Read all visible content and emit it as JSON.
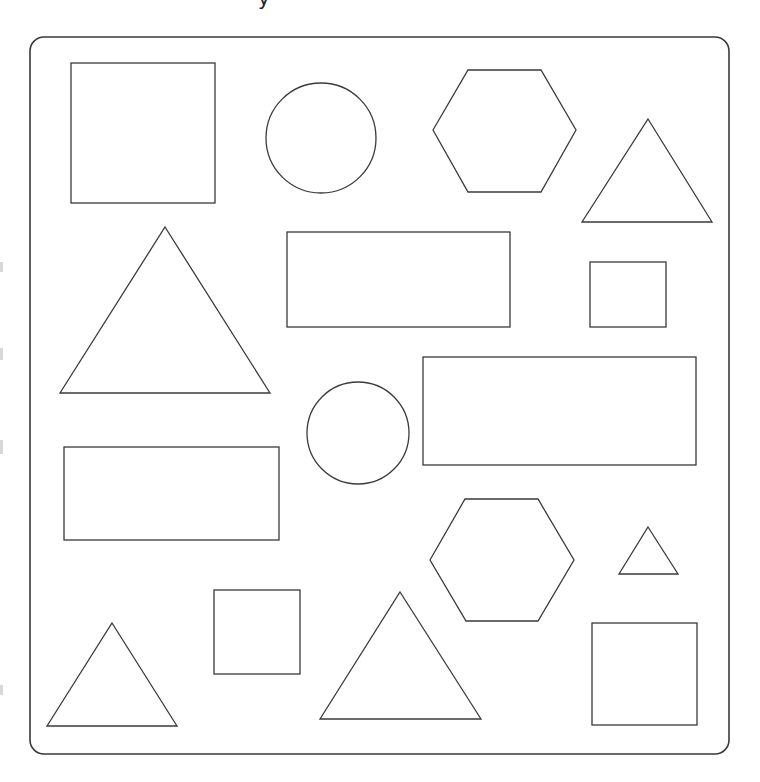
{
  "page": {
    "width": 760,
    "height": 782,
    "background": "#ffffff",
    "stroke_color": "#3a3a3a",
    "cut_off_text": "y"
  },
  "frame": {
    "x": 30,
    "y": 37,
    "width": 699,
    "height": 717,
    "radius": 14
  },
  "shapes": [
    {
      "id": "square-1",
      "type": "rect",
      "x": 71,
      "y": 63,
      "width": 144,
      "height": 140
    },
    {
      "id": "circle-1",
      "type": "circle",
      "cx": 321,
      "cy": 138,
      "r": 55
    },
    {
      "id": "hexagon-1",
      "type": "polygon",
      "points": "433,130 468,70 541,70 576,130 541,192 468,192"
    },
    {
      "id": "triangle-1",
      "type": "polygon",
      "points": "648,119 712,222 582,222"
    },
    {
      "id": "triangle-2",
      "type": "polygon",
      "points": "165,227 270,393 60,393"
    },
    {
      "id": "rect-1",
      "type": "rect",
      "x": 287,
      "y": 232,
      "width": 223,
      "height": 95
    },
    {
      "id": "square-2",
      "type": "rect",
      "x": 590,
      "y": 262,
      "width": 76,
      "height": 65
    },
    {
      "id": "rect-2",
      "type": "rect",
      "x": 423,
      "y": 357,
      "width": 273,
      "height": 108
    },
    {
      "id": "circle-2",
      "type": "circle",
      "cx": 358,
      "cy": 433,
      "r": 51
    },
    {
      "id": "rect-3",
      "type": "rect",
      "x": 64,
      "y": 447,
      "width": 215,
      "height": 93
    },
    {
      "id": "hexagon-2",
      "type": "polygon",
      "points": "430,560 465,499 538,499 574,560 538,621 466,621"
    },
    {
      "id": "triangle-3",
      "type": "polygon",
      "points": "648,527 678,574 619,574"
    },
    {
      "id": "square-3",
      "type": "rect",
      "x": 214,
      "y": 590,
      "width": 86,
      "height": 84
    },
    {
      "id": "triangle-4",
      "type": "polygon",
      "points": "112,623 177,726 47,726"
    },
    {
      "id": "triangle-5",
      "type": "polygon",
      "points": "400,592 481,719 320,719"
    },
    {
      "id": "square-4",
      "type": "rect",
      "x": 592,
      "y": 623,
      "width": 105,
      "height": 102
    }
  ]
}
